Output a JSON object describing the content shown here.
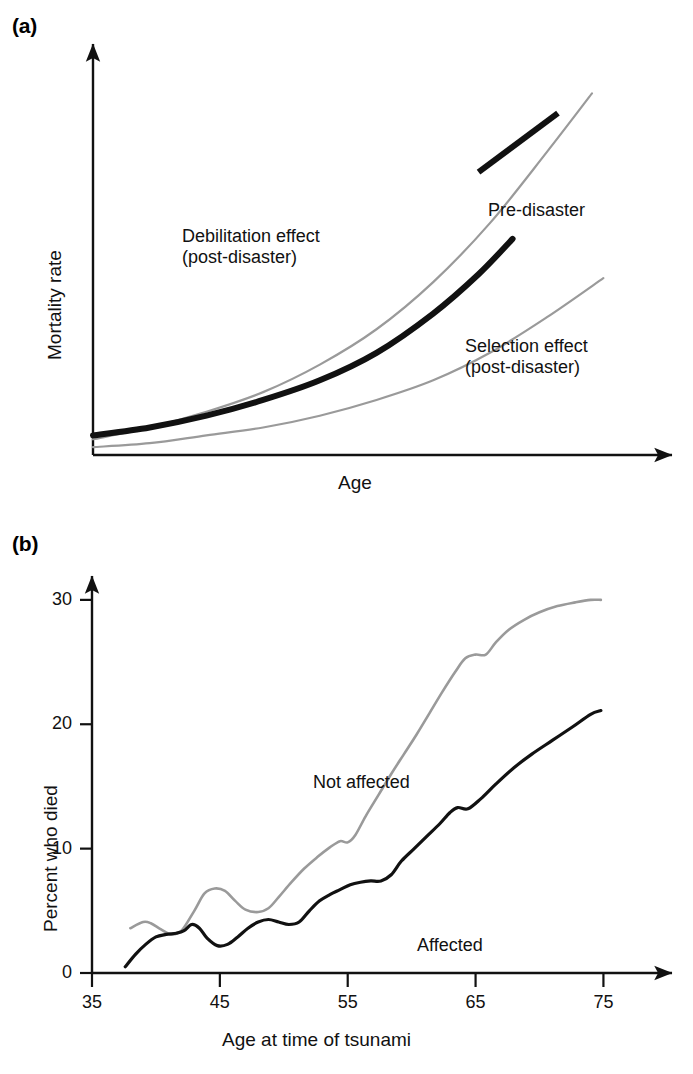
{
  "figure": {
    "background": "#ffffff",
    "ink_black": "#111111",
    "ink_gray": "#9a9a9a"
  },
  "panel_a": {
    "tag": "(a)",
    "ylabel": "Mortality rate",
    "xlabel": "Age",
    "labels": {
      "debilitation": "Debilitation effect\n(post-disaster)",
      "selection": "Selection effect\n(post-disaster)",
      "predisaster": "Pre-disaster"
    }
  },
  "panel_b": {
    "tag": "(b)",
    "ylabel": "Percent who died",
    "xlabel": "Age at time of tsunami",
    "labels": {
      "not_affected": "Not affected",
      "affected": "Affected"
    },
    "yticks": [
      "0",
      "10",
      "20",
      "30"
    ],
    "xticks": [
      "35",
      "45",
      "55",
      "65",
      "75"
    ]
  },
  "chart_data": [
    {
      "id": "panel-a",
      "type": "line",
      "title": "(a)",
      "xlabel": "Age",
      "ylabel": "Mortality rate",
      "axes": "schematic, no numeric tick labels",
      "grid": false,
      "legend": "inline annotations",
      "xlim": [
        0,
        100
      ],
      "ylim": [
        0,
        100
      ],
      "series": [
        {
          "name": "Debilitation effect (post-disaster)",
          "color": "#9a9a9a",
          "width": 2.2,
          "x": [
            0,
            10,
            20,
            30,
            40,
            50,
            60,
            70,
            80,
            88
          ],
          "y": [
            4,
            7,
            11,
            16,
            23,
            32,
            44,
            59,
            77,
            92
          ]
        },
        {
          "name": "Pre-disaster",
          "color": "#111111",
          "width": 6,
          "x": [
            0,
            10,
            20,
            30,
            40,
            50,
            60,
            68,
            74
          ],
          "y": [
            5,
            7,
            10,
            14,
            19,
            26,
            36,
            46,
            55
          ]
        },
        {
          "name": "Selection effect (post-disaster)",
          "color": "#9a9a9a",
          "width": 2.2,
          "x": [
            0,
            10,
            20,
            30,
            40,
            50,
            60,
            70,
            80,
            90
          ],
          "y": [
            2,
            3,
            5,
            7,
            10,
            14,
            19,
            26,
            35,
            45
          ]
        },
        {
          "name": "Pre-disaster legend swatch",
          "color": "#111111",
          "width": 6,
          "x": [
            68,
            82
          ],
          "y": [
            72,
            87
          ]
        }
      ]
    },
    {
      "id": "panel-b",
      "type": "line",
      "title": "(b)",
      "xlabel": "Age at time of tsunami",
      "ylabel": "Percent who died",
      "grid": false,
      "legend": "inline annotations",
      "xlim": [
        35,
        77
      ],
      "ylim": [
        0,
        32
      ],
      "xticks": [
        35,
        45,
        55,
        65,
        75
      ],
      "yticks": [
        0,
        10,
        20,
        30
      ],
      "series": [
        {
          "name": "Not affected",
          "color": "#9a9a9a",
          "width": 2.6,
          "x": [
            38.0,
            39.0,
            39.6,
            40.4,
            41.2,
            42.0,
            43.0,
            43.8,
            44.6,
            45.4,
            46.2,
            47.0,
            48.0,
            48.8,
            49.6,
            50.6,
            51.6,
            52.6,
            53.6,
            54.4,
            55.0,
            55.6,
            56.4,
            57.4,
            58.4,
            59.4,
            60.4,
            61.4,
            62.4,
            63.4,
            64.2,
            65.0,
            65.8,
            66.6,
            67.6,
            68.8,
            70.0,
            71.4,
            72.8,
            74.0,
            74.8
          ],
          "y": [
            3.6,
            4.1,
            4.0,
            3.5,
            3.1,
            3.4,
            5.0,
            6.4,
            6.8,
            6.6,
            5.8,
            5.1,
            4.9,
            5.2,
            6.1,
            7.3,
            8.4,
            9.3,
            10.1,
            10.6,
            10.5,
            11.1,
            12.6,
            14.3,
            16.0,
            17.6,
            19.2,
            20.9,
            22.6,
            24.2,
            25.3,
            25.6,
            25.6,
            26.6,
            27.6,
            28.4,
            29.0,
            29.5,
            29.8,
            30.0,
            30.0
          ]
        },
        {
          "name": "Affected",
          "color": "#111111",
          "width": 3.2,
          "x": [
            37.6,
            38.4,
            39.2,
            40.0,
            40.8,
            41.6,
            42.2,
            42.8,
            43.4,
            44.0,
            44.8,
            45.6,
            46.4,
            47.2,
            48.0,
            48.8,
            49.6,
            50.4,
            51.2,
            52.0,
            52.8,
            53.6,
            54.4,
            55.2,
            56.0,
            56.8,
            57.6,
            58.4,
            59.2,
            60.2,
            61.2,
            62.2,
            63.0,
            63.6,
            64.4,
            65.4,
            66.6,
            68.0,
            69.4,
            71.0,
            72.6,
            74.0,
            74.8
          ],
          "y": [
            0.5,
            1.5,
            2.3,
            2.9,
            3.1,
            3.2,
            3.4,
            3.9,
            3.6,
            2.8,
            2.2,
            2.3,
            2.9,
            3.6,
            4.1,
            4.3,
            4.1,
            3.9,
            4.1,
            5.0,
            5.8,
            6.3,
            6.7,
            7.1,
            7.3,
            7.4,
            7.4,
            7.9,
            9.0,
            10.0,
            11.0,
            12.0,
            12.9,
            13.3,
            13.2,
            14.0,
            15.2,
            16.5,
            17.6,
            18.7,
            19.8,
            20.8,
            21.1
          ]
        }
      ]
    }
  ]
}
